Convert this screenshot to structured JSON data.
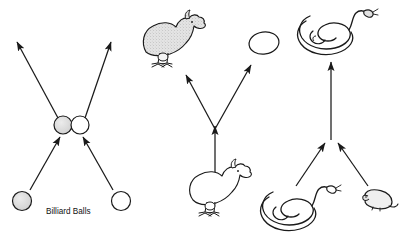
{
  "figure": {
    "background_color": "#ffffff",
    "stroke_color": "#1a1a1a",
    "shade_color": "#d9d9d9",
    "title": "",
    "panels": [
      {
        "id": "billiard-panel",
        "name": "Billiard Balls",
        "caption": "Billiard Balls",
        "process": "collision",
        "inputs": [
          "ball-left",
          "ball-right"
        ],
        "outputs": [
          "ball-left-after",
          "ball-right-after"
        ],
        "arrow_count": 4,
        "objects": [
          {
            "name": "ball-lower-left",
            "label": "",
            "fill": "shaded"
          },
          {
            "name": "ball-lower-right",
            "label": "",
            "fill": "white"
          },
          {
            "name": "ball-contact-left",
            "label": "",
            "fill": "shaded"
          },
          {
            "name": "ball-contact-right",
            "label": "",
            "fill": "white"
          }
        ]
      },
      {
        "id": "chicken-panel",
        "name": "Chicken and Egg",
        "caption": "",
        "process": "split",
        "inputs": [
          "chicken-bottom"
        ],
        "outputs": [
          "chicken-top-left",
          "egg-top-right"
        ],
        "arrow_count": 3,
        "objects": [
          {
            "name": "chicken-bottom",
            "label": "",
            "fill": "white"
          },
          {
            "name": "chicken-top-left",
            "label": "",
            "fill": "shaded"
          },
          {
            "name": "egg-top-right",
            "label": "",
            "fill": "white"
          }
        ]
      },
      {
        "id": "snake-panel",
        "name": "Snake and Mouse",
        "caption": "",
        "process": "merge",
        "inputs": [
          "snake-bottom-left",
          "mouse-bottom-right"
        ],
        "outputs": [
          "snake-top"
        ],
        "arrow_count": 3,
        "objects": [
          {
            "name": "snake-bottom-left",
            "label": "",
            "fill": "white"
          },
          {
            "name": "mouse-bottom-right",
            "label": "",
            "fill": "shaded"
          },
          {
            "name": "snake-top",
            "label": "",
            "fill": "shaded"
          }
        ]
      }
    ]
  }
}
